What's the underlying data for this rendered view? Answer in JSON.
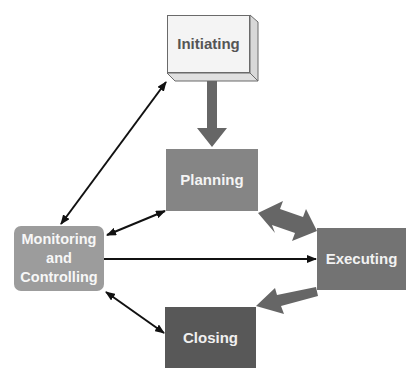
{
  "diagram": {
    "type": "process-flow",
    "nodes": [
      {
        "id": "initiating",
        "label": "Initiating",
        "fill": "#f4f4f4",
        "style": "3d-box"
      },
      {
        "id": "planning",
        "label": "Planning",
        "fill": "#858585"
      },
      {
        "id": "monitoring",
        "label_lines": [
          "Monitoring",
          "and",
          "Controlling"
        ],
        "fill": "#9c9c9c",
        "style": "rounded"
      },
      {
        "id": "executing",
        "label": "Executing",
        "fill": "#737373"
      },
      {
        "id": "closing",
        "label": "Closing",
        "fill": "#585858"
      }
    ],
    "edges": [
      {
        "from": "initiating",
        "to": "planning",
        "style": "thick-gray",
        "direction": "one-way"
      },
      {
        "from": "planning",
        "to": "executing",
        "style": "thick-gray",
        "direction": "two-way"
      },
      {
        "from": "executing",
        "to": "closing",
        "style": "thick-gray",
        "direction": "one-way"
      },
      {
        "from": "monitoring",
        "to": "initiating",
        "style": "thin-black",
        "direction": "two-way"
      },
      {
        "from": "monitoring",
        "to": "planning",
        "style": "thin-black",
        "direction": "two-way"
      },
      {
        "from": "monitoring",
        "to": "executing",
        "style": "thin-black",
        "direction": "one-way"
      },
      {
        "from": "monitoring",
        "to": "closing",
        "style": "thin-black",
        "direction": "two-way"
      }
    ]
  }
}
